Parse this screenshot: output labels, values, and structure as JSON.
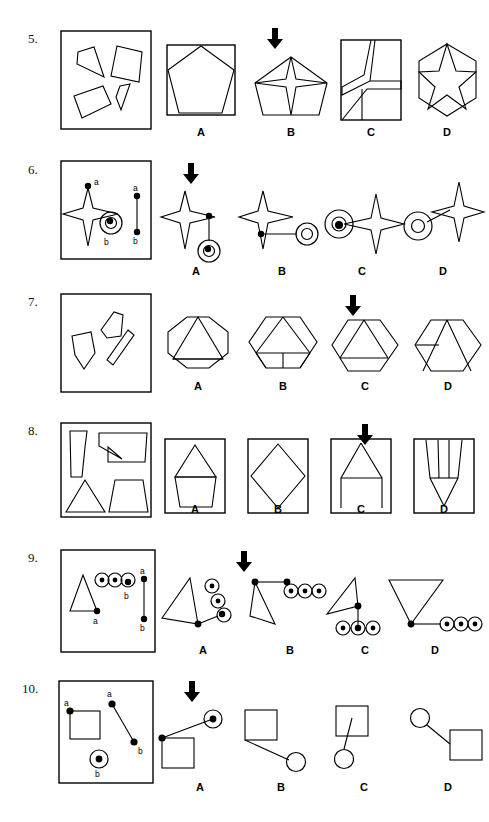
{
  "page": {
    "type": "spatial-reasoning-test",
    "background_color": "#ffffff",
    "ink_color": "#000000",
    "width": 489,
    "height": 822
  },
  "choice_letters": [
    "A",
    "B",
    "C",
    "D"
  ],
  "questions": [
    {
      "number": "5.",
      "stimulus_type": "scattered-polygons-in-box",
      "correct_choice": "B",
      "arrow_over": "B",
      "choices": [
        {
          "letter": "A",
          "figure": "pentagon-inscribed-in-square"
        },
        {
          "letter": "B",
          "figure": "four-point-star-inside-pentagon"
        },
        {
          "letter": "C",
          "figure": "rectangle-with-angular-partitions"
        },
        {
          "letter": "D",
          "figure": "five-point-star-inside-hexagon"
        }
      ]
    },
    {
      "number": "6.",
      "stimulus_type": "star-and-double-circle-with-points-a-b",
      "stimulus_labels": [
        "a",
        "b",
        "a",
        "b"
      ],
      "correct_choice": "A",
      "arrow_over": "A",
      "choices": [
        {
          "letter": "A",
          "figure": "star-joined-below-to-double-circle"
        },
        {
          "letter": "B",
          "figure": "star-joined-right-to-double-circle"
        },
        {
          "letter": "C",
          "figure": "double-circle-left-of-star-overlapping"
        },
        {
          "letter": "D",
          "figure": "double-circle-joined-up-right-to-star"
        }
      ]
    },
    {
      "number": "7.",
      "stimulus_type": "scattered-quadrilaterals-in-box",
      "correct_choice": "C",
      "arrow_over": "C",
      "choices": [
        {
          "letter": "A",
          "figure": "octagon-with-triangle"
        },
        {
          "letter": "B",
          "figure": "hexagon-with-triangles-and-stem"
        },
        {
          "letter": "C",
          "figure": "hexagon-with-large-triangle"
        },
        {
          "letter": "D",
          "figure": "hexagon-with-triangle-and-crossbar"
        }
      ]
    },
    {
      "number": "8.",
      "stimulus_type": "four-shapes-in-box",
      "correct_choice": "C",
      "arrow_over": "C",
      "choices": [
        {
          "letter": "A",
          "figure": "house-pentagon-triangle-in-square"
        },
        {
          "letter": "B",
          "figure": "diamond-in-square"
        },
        {
          "letter": "C",
          "figure": "triangle-on-legs-in-square"
        },
        {
          "letter": "D",
          "figure": "narrow-spike-shape-in-square"
        }
      ]
    },
    {
      "number": "9.",
      "stimulus_type": "triangle-and-three-ringed-dots-with-points-a-b",
      "stimulus_labels": [
        "b",
        "a",
        "a",
        "b"
      ],
      "correct_choice": "A",
      "arrow_over": "A",
      "choices": [
        {
          "letter": "A",
          "figure": "triangle-with-diagonal-chain-of-rings"
        },
        {
          "letter": "B",
          "figure": "triangle-with-horizontal-chain-of-rings-top"
        },
        {
          "letter": "C",
          "figure": "triangle-with-chain-of-rings-below"
        },
        {
          "letter": "D",
          "figure": "inverted-triangle-with-chain-of-rings-right"
        }
      ]
    },
    {
      "number": "10.",
      "stimulus_type": "square-and-ringed-dot-with-points-a-b",
      "stimulus_labels": [
        "a",
        "a",
        "b",
        "b"
      ],
      "correct_choice": "A",
      "arrow_over": "A",
      "choices": [
        {
          "letter": "A",
          "figure": "square-joined-up-right-to-ringed-dot"
        },
        {
          "letter": "B",
          "figure": "square-joined-down-right-to-circle"
        },
        {
          "letter": "C",
          "figure": "square-joined-down-to-circle"
        },
        {
          "letter": "D",
          "figure": "circle-joined-down-right-to-square"
        }
      ]
    }
  ]
}
